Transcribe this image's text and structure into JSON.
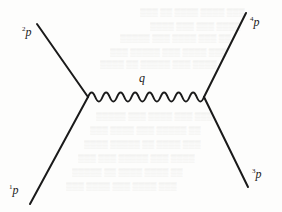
{
  "diagram": {
    "type": "feynman-diagram",
    "colors": {
      "line": "#1a1a1a",
      "background": "#fdfdfc"
    },
    "vertices": [
      {
        "id": "left-vertex",
        "x": 88,
        "y": 97
      },
      {
        "id": "right-vertex",
        "x": 204,
        "y": 97
      }
    ],
    "external_lines": [
      {
        "id": "p2",
        "label_super": "2",
        "label": "p",
        "from": [
          37,
          24
        ],
        "to": [
          88,
          97
        ],
        "label_pos": [
          22,
          27
        ]
      },
      {
        "id": "p1",
        "label_super": "1",
        "label": "p",
        "from": [
          30,
          204
        ],
        "to": [
          88,
          97
        ],
        "label_pos": [
          9,
          184
        ]
      },
      {
        "id": "p4",
        "label_super": "4",
        "label": "p",
        "from": [
          246,
          13
        ],
        "to": [
          204,
          97
        ],
        "label_pos": [
          250,
          18
        ]
      },
      {
        "id": "p3",
        "label_super": "3",
        "label": "p",
        "from": [
          248,
          187
        ],
        "to": [
          204,
          97
        ],
        "label_pos": [
          252,
          170
        ]
      }
    ],
    "propagator": {
      "id": "q",
      "label": "q",
      "style": "wavy",
      "label_pos": [
        140,
        74
      ]
    }
  }
}
